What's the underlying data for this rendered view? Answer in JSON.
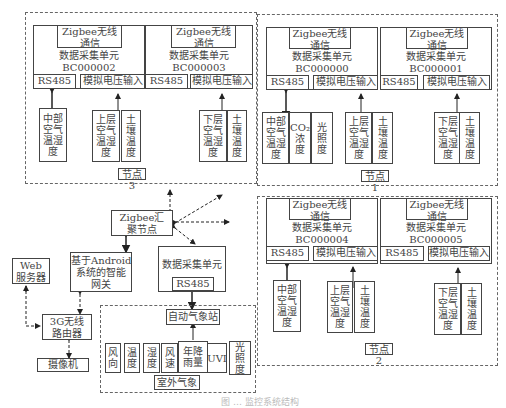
{
  "common": {
    "zigbee_comm": "Zigbee无线\n通信",
    "dau": "数据采集单元",
    "rs485": "RS485",
    "analog": "模拟电压输入"
  },
  "node3": {
    "label": "节点3",
    "units": [
      {
        "id": "BC000002",
        "sensors_rs485": [
          "中部\n空气\n温湿\n度"
        ],
        "sensors_analog": [
          "上层\n空气\n温湿\n度",
          "土\n壤\n温\n度"
        ]
      },
      {
        "id": "BC000003",
        "sensors_analog": [
          "下层\n空气\n温湿\n度",
          "土\n壤\n温\n度"
        ]
      }
    ]
  },
  "node1": {
    "label": "节点1",
    "units": [
      {
        "id": "BC000000",
        "sensors_rs485": [
          "中部\n空气\n温湿\n度",
          "CO₂\n浓\n度",
          "光\n照\n度"
        ],
        "sensors_analog": [
          "上层\n空气\n温湿\n度",
          "土\n壤\n温\n度"
        ]
      },
      {
        "id": "BC000001",
        "sensors_analog": [
          "下层\n空气\n温湿\n度",
          "土\n壤\n温\n度"
        ]
      }
    ]
  },
  "node2": {
    "label": "节点2",
    "units": [
      {
        "id": "BC000004",
        "sensors_rs485": [
          "中部\n空气\n温湿\n度"
        ],
        "sensors_analog": [
          "上层\n空气\n温湿\n度",
          "土\n壤\n温\n度"
        ]
      },
      {
        "id": "BC000005",
        "sensors_analog": [
          "下层\n空气\n温湿\n度",
          "土\n壤\n温\n度"
        ]
      }
    ]
  },
  "center": {
    "zigbee_sink": "Zigbee汇\n聚节点",
    "gateway": "基于Android\n系统的智能\n网关",
    "web_server": "Web\n服务器",
    "router": "3G无线\n路由器",
    "camera": "摄像机",
    "dau": "数据采集单元",
    "rs485": "RS485"
  },
  "weather": {
    "station": "自动气象站",
    "label": "室外气象",
    "sensors": [
      "风\n向",
      "温\n度",
      "湿\n度",
      "风\n速",
      "年降\n雨量",
      "UVI",
      "光\n照\n度"
    ]
  },
  "caption": "图 … 监控系统结构"
}
